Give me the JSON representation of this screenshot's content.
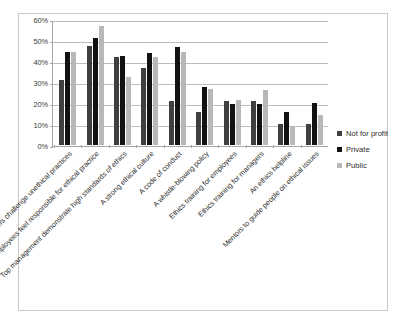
{
  "chart_data": {
    "type": "bar",
    "title": "",
    "subtitle": "",
    "xlabel": "",
    "ylabel": "",
    "ylim": [
      0,
      60
    ],
    "ytick_labels": [
      "60%",
      "50%",
      "40%",
      "30%",
      "20%",
      "10%",
      "0%"
    ],
    "ytick_values": [
      60,
      50,
      40,
      30,
      20,
      10,
      0
    ],
    "grid": true,
    "legend_position": "right",
    "categories": [
      "Managers challenge unethical practices",
      "Employees feel responsible for ethical practice",
      "Top management demonstrate high standards of ethics",
      "A strong ethical culture",
      "A code of conduct",
      "A whistle-blowing policy",
      "Ethics training for employees",
      "Ethics training for managers",
      "An ethics helpline",
      "Mentors to guide people on ethical issues"
    ],
    "series": [
      {
        "name": "Not for profit",
        "color": "#3f3f3f",
        "values": [
          31,
          47,
          42,
          36.5,
          21,
          15.5,
          21,
          21,
          10,
          10
        ]
      },
      {
        "name": "Private",
        "color": "#121212",
        "values": [
          44.5,
          51,
          42.5,
          44,
          46.5,
          27.5,
          19.5,
          19.5,
          15.5,
          20
        ]
      },
      {
        "name": "Public",
        "color": "#b8b8b8",
        "values": [
          44.5,
          56.5,
          32.5,
          42,
          44.5,
          26.5,
          21.5,
          26,
          8.5,
          14.5
        ]
      }
    ]
  }
}
